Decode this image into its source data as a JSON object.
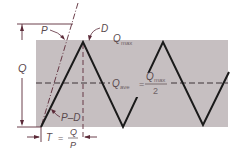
{
  "diagram": {
    "type": "inventory-sawtooth",
    "colors": {
      "background": "#ffffff",
      "shaded_region": "#c6bfc1",
      "sawtooth_line": "#1a1a1a",
      "dimension_lines": "#5b2a38",
      "label_text": "#5a4a4e"
    },
    "labels": {
      "p": "P",
      "d": "D",
      "q_left": "Q",
      "q_max": {
        "main": "Q",
        "sub": "max"
      },
      "q_ave": {
        "main": "Q",
        "sub": "ave",
        "equals": "=",
        "numerator_main": "Q",
        "numerator_sub": "max",
        "denominator": "2"
      },
      "p_minus_d": "P–D",
      "t_formula": {
        "lhs": "T",
        "equals": "=",
        "numerator": "Q",
        "denominator": "P"
      }
    }
  }
}
